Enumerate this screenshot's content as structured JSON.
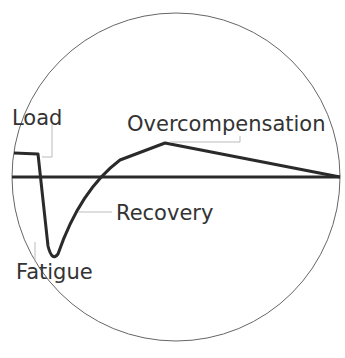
{
  "diagram": {
    "labels": {
      "load": "Load",
      "fatigue": "Fatigue",
      "recovery": "Recovery",
      "overcompensation": "Overcompensation"
    },
    "colors": {
      "curve": "#2a2a2a",
      "circle": "#555555",
      "leader": "#bbbbbb",
      "text": "#333333"
    }
  }
}
